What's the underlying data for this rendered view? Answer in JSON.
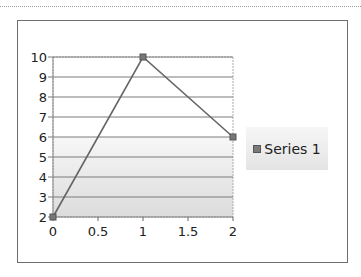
{
  "chart_data": {
    "type": "line",
    "title": "",
    "xlabel": "",
    "ylabel": "",
    "x": [
      0,
      1,
      2
    ],
    "series": [
      {
        "name": "Series 1",
        "values": [
          2,
          10,
          6
        ],
        "color": "#666666"
      }
    ],
    "xlim": [
      0,
      2
    ],
    "ylim": [
      2,
      10
    ],
    "x_ticks": [
      "0",
      "0.5",
      "1",
      "1.5",
      "2"
    ],
    "y_ticks": [
      "2",
      "3",
      "4",
      "5",
      "6",
      "7",
      "8",
      "9",
      "10"
    ],
    "grid": {
      "horizontal": true,
      "vertical": false
    },
    "legend": {
      "position": "right",
      "entries": [
        "Series 1"
      ]
    },
    "shaded_region": {
      "from_y": 2,
      "to_y": 6
    }
  },
  "legend": {
    "label": "Series 1"
  }
}
